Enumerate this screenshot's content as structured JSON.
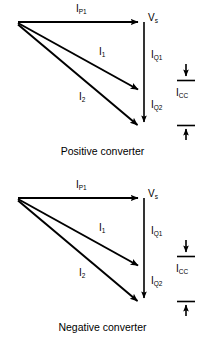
{
  "figure": {
    "type": "phasor-diagram-pair",
    "stroke_color": "#000000",
    "background_color": "#ffffff",
    "width": 205,
    "height": 352
  },
  "panels": [
    {
      "id": "positive-converter",
      "caption": "Positive converter",
      "labels": {
        "ip1": "I",
        "ip1_sub": "P1",
        "vs": "V",
        "vs_sub": "s",
        "i1": "I",
        "i1_sub": "1",
        "iq1": "I",
        "iq1_sub": "Q1",
        "i2": "I",
        "i2_sub": "2",
        "iq2": "I",
        "iq2_sub": "Q2",
        "icc": "I",
        "icc_sub": "CC"
      },
      "geometry": {
        "origin": [
          18,
          22
        ],
        "vs_tip": [
          144,
          22
        ],
        "i1_tip": [
          144,
          92
        ],
        "i2_tip": [
          144,
          128
        ],
        "vertical_axis_x": 144,
        "icc_marker_x": 186,
        "icc_top_tick_y": 80,
        "icc_bottom_tick_y": 126
      }
    },
    {
      "id": "negative-converter",
      "caption": "Negative converter",
      "labels": {
        "ip1": "I",
        "ip1_sub": "P1",
        "vs": "V",
        "vs_sub": "s",
        "i1": "I",
        "i1_sub": "1",
        "iq1": "I",
        "iq1_sub": "Q1",
        "i2": "I",
        "i2_sub": "2",
        "iq2": "I",
        "iq2_sub": "Q2",
        "icc": "I",
        "icc_sub": "CC"
      },
      "geometry": {
        "origin": [
          18,
          22
        ],
        "vs_tip": [
          144,
          22
        ],
        "i1_tip": [
          144,
          92
        ],
        "i2_tip": [
          144,
          128
        ],
        "vertical_axis_x": 144,
        "icc_marker_x": 186,
        "icc_top_tick_y": 80,
        "icc_bottom_tick_y": 126
      }
    }
  ]
}
